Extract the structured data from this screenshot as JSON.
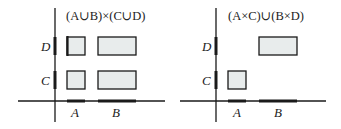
{
  "panels": [
    {
      "title": "(A∪B)×(C∪D)",
      "x_labels": [
        "A",
        "B"
      ],
      "y_labels": [
        "D",
        "C"
      ],
      "rects": [
        "A×D",
        "B×D",
        "A×C",
        "B×C"
      ]
    },
    {
      "title": "(A×C)∪(B×D)",
      "x_labels": [
        "A",
        "B"
      ],
      "y_labels": [
        "D",
        "C"
      ],
      "rects": [
        "B×D",
        "A×C"
      ]
    }
  ],
  "colors": {
    "fill": "#e8ecec",
    "stroke": "#1a1a1a"
  }
}
